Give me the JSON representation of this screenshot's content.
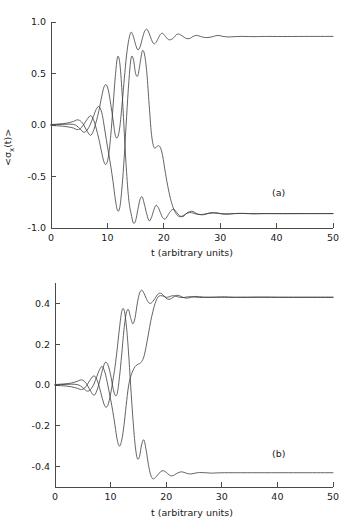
{
  "figure": {
    "background": "#ffffff",
    "curve_color": "#3c3c3c",
    "axis_color": "#4a4a4a"
  },
  "panels": [
    {
      "tag": "(a)",
      "ylabel": "<σx(t)>",
      "ylabel_main": "<σ",
      "ylabel_sub": "x",
      "ylabel_tail": "(t)>",
      "xlabel": "t (arbitrary units)",
      "xticks": [
        "0",
        "10",
        "20",
        "30",
        "40",
        "50"
      ],
      "yticks": [
        "-1.0",
        "-0.5",
        "0.0",
        "0.5",
        "1.0"
      ]
    },
    {
      "tag": "(b)",
      "ylabel": "x(t)",
      "xlabel": "t (arbitrary units)",
      "xticks": [
        "0",
        "10",
        "20",
        "30",
        "40",
        "50"
      ],
      "yticks": [
        "-0.4",
        "-0.2",
        "0.0",
        "0.2",
        "0.4"
      ]
    }
  ],
  "chart_data": [
    {
      "type": "line",
      "panel": "(a)",
      "title": "",
      "xlabel": "t (arbitrary units)",
      "ylabel": "<sigma_x(t)>",
      "xlim": [
        0,
        50
      ],
      "ylim": [
        -1.0,
        1.0
      ],
      "xticks": [
        0,
        10,
        20,
        30,
        40,
        50
      ],
      "yticks": [
        -1.0,
        -0.5,
        0.0,
        0.5,
        1.0
      ],
      "grid": false,
      "legend": null,
      "annotations": [
        {
          "text": "(a)",
          "x": 41,
          "y": -0.62
        }
      ],
      "series": [
        {
          "name": "trajectory-1-up",
          "plateau": 0.86,
          "x": [
            0,
            1,
            2,
            3,
            4,
            4.6,
            5.2,
            5.8,
            6.4,
            7,
            7.5,
            8,
            8.5,
            9,
            9.4,
            9.8,
            10.2,
            10.6,
            11,
            11.4,
            11.8,
            12.2,
            12.6,
            13,
            13.4,
            13.8,
            14.2,
            14.6,
            15,
            15.4,
            15.8,
            16.2,
            16.6,
            17,
            17.4,
            17.8,
            18.2,
            18.6,
            19,
            19.4,
            19.8,
            20.3,
            20.8,
            21.3,
            21.8,
            22.3,
            22.8,
            23.4,
            24,
            24.6,
            25.2,
            25.8,
            26.5,
            27.2,
            28,
            28.8,
            29.6,
            30.5,
            31.5,
            32.5,
            34,
            36,
            38,
            41,
            45,
            50
          ],
          "y": [
            0.005,
            0.008,
            0.012,
            0.02,
            0.035,
            0.05,
            0.04,
            0.0,
            -0.06,
            -0.1,
            -0.06,
            0.03,
            0.14,
            0.28,
            0.37,
            0.39,
            0.33,
            0.2,
            0.05,
            -0.1,
            -0.12,
            -0.02,
            0.2,
            0.45,
            0.68,
            0.83,
            0.9,
            0.86,
            0.78,
            0.73,
            0.76,
            0.84,
            0.91,
            0.93,
            0.89,
            0.83,
            0.79,
            0.8,
            0.84,
            0.88,
            0.89,
            0.86,
            0.83,
            0.83,
            0.85,
            0.88,
            0.88,
            0.86,
            0.84,
            0.84,
            0.86,
            0.87,
            0.86,
            0.85,
            0.85,
            0.86,
            0.87,
            0.86,
            0.855,
            0.858,
            0.86,
            0.858,
            0.86,
            0.859,
            0.86,
            0.86
          ]
        },
        {
          "name": "trajectory-2-down",
          "plateau": -0.86,
          "x": [
            0,
            1,
            2,
            3,
            4,
            4.6,
            5.2,
            5.8,
            6.4,
            7,
            7.5,
            8,
            8.5,
            9,
            9.4,
            9.8,
            10.2,
            10.6,
            11,
            11.4,
            11.8,
            12.2,
            12.6,
            13,
            13.4,
            13.8,
            14.2,
            14.6,
            15,
            15.4,
            15.8,
            16.2,
            16.6,
            17,
            17.4,
            17.8,
            18.2,
            18.6,
            19,
            19.4,
            19.8,
            20.3,
            20.8,
            21.3,
            21.8,
            22.3,
            22.8,
            23.4,
            24,
            24.6,
            25.2,
            25.8,
            26.5,
            27.2,
            28,
            28.8,
            29.6,
            30.5,
            31.5,
            32.5,
            34,
            36,
            38,
            41,
            45,
            50
          ],
          "y": [
            -0.004,
            -0.007,
            -0.011,
            -0.018,
            -0.03,
            -0.045,
            -0.035,
            0.005,
            0.055,
            0.09,
            0.055,
            -0.03,
            -0.14,
            -0.27,
            -0.36,
            -0.38,
            -0.3,
            -0.1,
            0.18,
            0.47,
            0.66,
            0.6,
            0.32,
            -0.08,
            -0.46,
            -0.73,
            -0.86,
            -0.95,
            -0.93,
            -0.82,
            -0.72,
            -0.7,
            -0.78,
            -0.87,
            -0.93,
            -0.9,
            -0.83,
            -0.78,
            -0.8,
            -0.85,
            -0.9,
            -0.91,
            -0.87,
            -0.83,
            -0.82,
            -0.85,
            -0.88,
            -0.89,
            -0.86,
            -0.84,
            -0.84,
            -0.86,
            -0.87,
            -0.87,
            -0.855,
            -0.85,
            -0.855,
            -0.865,
            -0.866,
            -0.86,
            -0.858,
            -0.862,
            -0.86,
            -0.861,
            -0.86,
            -0.86
          ]
        },
        {
          "name": "trajectory-3-late-down",
          "plateau": -0.86,
          "x": [
            0,
            1,
            2,
            3,
            4,
            4.6,
            5.2,
            5.8,
            6.4,
            7,
            7.5,
            8,
            8.5,
            9,
            9.4,
            9.8,
            10.2,
            10.6,
            11,
            11.4,
            11.8,
            12.2,
            12.6,
            13,
            13.4,
            13.8,
            14.2,
            14.6,
            15,
            15.4,
            15.8,
            16.2,
            16.6,
            17,
            17.4,
            17.8,
            18.2,
            18.6,
            19,
            19.4,
            19.8,
            20.3,
            20.8,
            21.3,
            21.8,
            22.3,
            22.8,
            23.4,
            24,
            24.6,
            25.2,
            25.8,
            26.5,
            27.2,
            28,
            28.8,
            29.6,
            30.5,
            31.5,
            32.5,
            34,
            36,
            38,
            41,
            45,
            50
          ],
          "y": [
            0.003,
            0.004,
            0.006,
            0.008,
            0.005,
            -0.01,
            -0.04,
            -0.07,
            -0.05,
            0.01,
            0.08,
            0.15,
            0.18,
            0.12,
            0.0,
            -0.14,
            -0.27,
            -0.4,
            -0.55,
            -0.72,
            -0.83,
            -0.8,
            -0.6,
            -0.3,
            0.08,
            0.42,
            0.65,
            0.64,
            0.5,
            0.48,
            0.6,
            0.72,
            0.68,
            0.5,
            0.2,
            -0.08,
            -0.21,
            -0.22,
            -0.2,
            -0.22,
            -0.3,
            -0.47,
            -0.62,
            -0.74,
            -0.82,
            -0.87,
            -0.89,
            -0.88,
            -0.86,
            -0.85,
            -0.855,
            -0.865,
            -0.87,
            -0.865,
            -0.858,
            -0.855,
            -0.858,
            -0.862,
            -0.862,
            -0.86,
            -0.859,
            -0.861,
            -0.86,
            -0.86,
            -0.86,
            -0.86
          ]
        }
      ]
    },
    {
      "type": "line",
      "panel": "(b)",
      "title": "",
      "xlabel": "t (arbitrary units)",
      "ylabel": "x(t)",
      "xlim": [
        0,
        50
      ],
      "ylim": [
        -0.5,
        0.5
      ],
      "xticks": [
        0,
        10,
        20,
        30,
        40,
        50
      ],
      "yticks": [
        -0.4,
        -0.2,
        0.0,
        0.2,
        0.4
      ],
      "grid": false,
      "legend": null,
      "annotations": [
        {
          "text": "(b)",
          "x": 41,
          "y": -0.355
        }
      ],
      "series": [
        {
          "name": "trajectory-1-up",
          "plateau": 0.43,
          "x": [
            0,
            1,
            2,
            3,
            4,
            4.6,
            5.2,
            5.8,
            6.4,
            7,
            7.5,
            8,
            8.5,
            9,
            9.5,
            10,
            10.4,
            10.8,
            11.2,
            11.6,
            12,
            12.4,
            12.8,
            13.2,
            13.6,
            14,
            14.4,
            14.8,
            15.2,
            15.6,
            16,
            16.4,
            16.8,
            17.2,
            17.6,
            18,
            18.5,
            19,
            19.5,
            20,
            20.5,
            21,
            21.5,
            22,
            22.6,
            23.2,
            23.8,
            24.5,
            25.2,
            26,
            27,
            28,
            29,
            30.5,
            32,
            34,
            37,
            41,
            45,
            50
          ],
          "y": [
            0.002,
            0.004,
            0.006,
            0.01,
            0.018,
            0.025,
            0.02,
            0.0,
            -0.03,
            -0.05,
            -0.03,
            0.015,
            0.07,
            0.11,
            0.1,
            0.05,
            -0.01,
            -0.05,
            -0.04,
            0.04,
            0.15,
            0.27,
            0.35,
            0.37,
            0.33,
            0.3,
            0.33,
            0.4,
            0.45,
            0.465,
            0.45,
            0.425,
            0.405,
            0.4,
            0.41,
            0.425,
            0.445,
            0.45,
            0.44,
            0.425,
            0.42,
            0.425,
            0.435,
            0.44,
            0.435,
            0.428,
            0.426,
            0.43,
            0.434,
            0.433,
            0.43,
            0.429,
            0.431,
            0.432,
            0.43,
            0.43,
            0.431,
            0.43,
            0.43,
            0.43
          ]
        },
        {
          "name": "trajectory-2-down",
          "plateau": -0.43,
          "x": [
            0,
            1,
            2,
            3,
            4,
            4.6,
            5.2,
            5.8,
            6.4,
            7,
            7.5,
            8,
            8.5,
            9,
            9.5,
            10,
            10.4,
            10.8,
            11.2,
            11.6,
            12,
            12.4,
            12.8,
            13.2,
            13.6,
            14,
            14.4,
            14.8,
            15.2,
            15.6,
            16,
            16.4,
            16.8,
            17.2,
            17.6,
            18,
            18.5,
            19,
            19.5,
            20,
            20.5,
            21,
            21.5,
            22,
            22.6,
            23.2,
            23.8,
            24.5,
            25.2,
            26,
            27,
            28,
            29,
            30.5,
            32,
            34,
            37,
            41,
            45,
            50
          ],
          "y": [
            -0.002,
            -0.003,
            -0.005,
            -0.009,
            -0.016,
            -0.022,
            -0.018,
            0.002,
            0.028,
            0.045,
            0.028,
            -0.012,
            -0.065,
            -0.105,
            -0.1,
            -0.045,
            0.02,
            0.09,
            0.18,
            0.28,
            0.36,
            0.37,
            0.3,
            0.17,
            0.0,
            -0.16,
            -0.29,
            -0.36,
            -0.35,
            -0.29,
            -0.27,
            -0.32,
            -0.39,
            -0.44,
            -0.46,
            -0.455,
            -0.44,
            -0.425,
            -0.42,
            -0.428,
            -0.44,
            -0.446,
            -0.44,
            -0.432,
            -0.426,
            -0.428,
            -0.434,
            -0.436,
            -0.432,
            -0.429,
            -0.43,
            -0.432,
            -0.431,
            -0.43,
            -0.43,
            -0.43,
            -0.43,
            -0.43,
            -0.43,
            -0.43
          ]
        },
        {
          "name": "trajectory-3-late-up",
          "plateau": 0.43,
          "x": [
            0,
            1,
            2,
            3,
            4,
            4.6,
            5.2,
            5.8,
            6.4,
            7,
            7.5,
            8,
            8.5,
            9,
            9.5,
            10,
            10.4,
            10.8,
            11.2,
            11.6,
            12,
            12.4,
            12.8,
            13.2,
            13.6,
            14,
            14.4,
            14.8,
            15.2,
            15.6,
            16,
            16.4,
            16.8,
            17.2,
            17.6,
            18,
            18.5,
            19,
            19.5,
            20,
            20.5,
            21,
            21.5,
            22,
            22.6,
            23.2,
            23.8,
            24.5,
            25.2,
            26,
            27,
            28,
            29,
            30.5,
            32,
            34,
            37,
            41,
            45,
            50
          ],
          "y": [
            0.001,
            0.002,
            0.003,
            0.004,
            0.002,
            -0.005,
            -0.018,
            -0.03,
            -0.022,
            0.005,
            0.04,
            0.075,
            0.09,
            0.06,
            0.0,
            -0.07,
            -0.13,
            -0.2,
            -0.27,
            -0.3,
            -0.27,
            -0.2,
            -0.1,
            -0.01,
            0.04,
            0.07,
            0.09,
            0.1,
            0.105,
            0.115,
            0.14,
            0.19,
            0.25,
            0.31,
            0.36,
            0.4,
            0.43,
            0.438,
            0.435,
            0.43,
            0.432,
            0.437,
            0.437,
            0.433,
            0.429,
            0.429,
            0.432,
            0.433,
            0.431,
            0.429,
            0.43,
            0.431,
            0.43,
            0.43,
            0.43,
            0.43,
            0.43,
            0.43,
            0.43,
            0.43
          ]
        }
      ]
    }
  ]
}
